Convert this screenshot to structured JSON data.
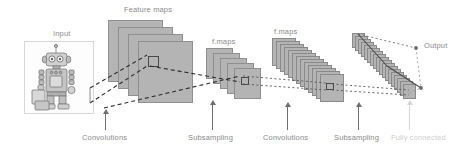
{
  "figure": {
    "background_color": "#ffffff",
    "plane_fill": "#b4b4b4",
    "plane_stroke": "#8f8f8f",
    "label_color": "#8a8a8a",
    "faint_label_color": "#cfcfcf"
  },
  "labels": {
    "input": "Input",
    "feature_maps": "Feature maps",
    "fmaps_2": "f.maps",
    "fmaps_3": "f.maps",
    "output": "Output"
  },
  "stage_labels": [
    {
      "id": "convolutions-1",
      "text": "Convolutions",
      "style": "normal"
    },
    {
      "id": "subsampling-1",
      "text": "Subsampling",
      "style": "normal"
    },
    {
      "id": "convolutions-2",
      "text": "Convolutions",
      "style": "normal"
    },
    {
      "id": "subsampling-2",
      "text": "Subsampling",
      "style": "normal"
    },
    {
      "id": "fully-connected",
      "text": "Fully connected",
      "style": "faint"
    }
  ],
  "layers": [
    {
      "id": "input-image",
      "kind": "image",
      "count": 1,
      "note": "sketched robot photograph"
    },
    {
      "id": "conv1-feature-maps",
      "kind": "planes",
      "count": 4,
      "label": "Feature maps"
    },
    {
      "id": "pool1-feature-maps",
      "kind": "planes",
      "count": 5,
      "label": "f.maps"
    },
    {
      "id": "conv2-feature-maps",
      "kind": "planes",
      "count": 13,
      "label": "f.maps"
    },
    {
      "id": "pool2-feature-maps",
      "kind": "planes",
      "count": 18,
      "label": ""
    },
    {
      "id": "fc-output",
      "kind": "vector",
      "count": 1,
      "label": "Output"
    }
  ]
}
